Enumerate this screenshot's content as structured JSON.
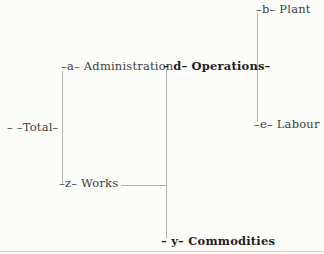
{
  "diagram": {
    "type": "tree",
    "background_color": "#fcfcf9",
    "line_color": "#b2b2b0",
    "text_color": "#3d3d3d",
    "emphasis_text_color": "#1f1f1f",
    "nodes": {
      "total": {
        "code": "",
        "name": "Total",
        "label": "– –Total–"
      },
      "administration": {
        "code": "a",
        "name": "Administration",
        "label": "–a– Administration"
      },
      "operations": {
        "code": "d",
        "name": "Operations",
        "label": "– d– Operations–"
      },
      "plant": {
        "code": "b",
        "name": "Plant",
        "label": "–b– Plant"
      },
      "labour": {
        "code": "e",
        "name": "Labour",
        "label": "–e– Labour"
      },
      "works": {
        "code": "z",
        "name": "Works",
        "label": "–z– Works"
      },
      "commodities": {
        "code": "y",
        "name": "Commodities",
        "label": "– y– Commodities"
      }
    },
    "hierarchy": {
      "root": "Total",
      "children": [
        {
          "code": "a",
          "name": "Administration",
          "children": []
        },
        {
          "code": "z",
          "name": "Works",
          "children": [
            {
              "code": "d",
              "name": "Operations",
              "children": [
                {
                  "code": "b",
                  "name": "Plant",
                  "children": []
                },
                {
                  "code": "e",
                  "name": "Labour",
                  "children": []
                }
              ]
            },
            {
              "code": "y",
              "name": "Commodities",
              "children": []
            }
          ]
        }
      ]
    }
  }
}
